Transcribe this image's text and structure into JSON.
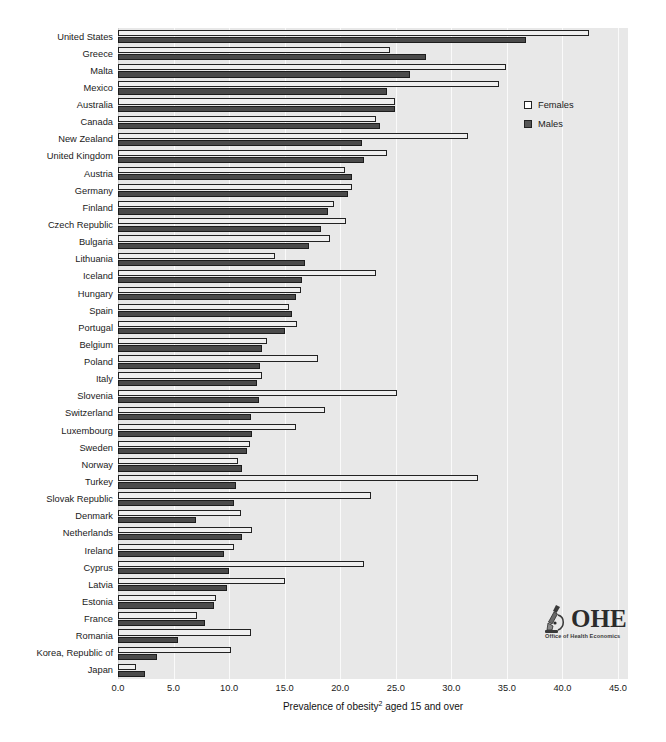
{
  "chart_data": {
    "type": "bar",
    "orientation": "horizontal",
    "title": "",
    "xlabel": "Prevalence of obesity2 aged 15 and over",
    "xlabel_base": "Prevalence of obesity",
    "xlabel_sup": "2",
    "xlabel_tail": " aged 15 and over",
    "ylabel": "",
    "xlim": [
      0.0,
      45.9
    ],
    "xticks": [
      "0.0",
      "5.0",
      "10.0",
      "15.0",
      "20.0",
      "25.0",
      "30.0",
      "35.0",
      "40.0",
      "45.0"
    ],
    "xtick_values": [
      0,
      5,
      10,
      15,
      20,
      25,
      30,
      35,
      40,
      45
    ],
    "grid": true,
    "legend_position": "upper right",
    "categories": [
      "United States",
      "Greece",
      "Malta",
      "Mexico",
      "Australia",
      "Canada",
      "New Zealand",
      "United Kingdom",
      "Austria",
      "Germany",
      "Finland",
      "Czech Republic",
      "Bulgaria",
      "Lithuania",
      "Iceland",
      "Hungary",
      "Spain",
      "Portugal",
      "Belgium",
      "Poland",
      "Italy",
      "Slovenia",
      "Switzerland",
      "Luxembourg",
      "Sweden",
      "Norway",
      "Turkey",
      "Slovak Republic",
      "Denmark",
      "Netherlands",
      "Ireland",
      "Cyprus",
      "Latvia",
      "Estonia",
      "France",
      "Romania",
      "Korea, Republic of",
      "Japan"
    ],
    "series": [
      {
        "name": "Females",
        "color": "#efefef",
        "values": [
          42.4,
          24.5,
          34.9,
          34.3,
          24.9,
          23.2,
          31.5,
          24.2,
          20.4,
          21.1,
          19.4,
          20.5,
          19.1,
          14.1,
          23.2,
          16.5,
          15.4,
          16.1,
          13.4,
          18.0,
          13.0,
          25.1,
          18.6,
          16.0,
          11.9,
          10.8,
          32.4,
          22.8,
          11.1,
          12.1,
          10.4,
          22.1,
          15.0,
          8.8,
          7.1,
          12.0,
          10.2,
          1.6
        ]
      },
      {
        "name": "Males",
        "color": "#4a4a4a",
        "values": [
          36.7,
          27.7,
          26.3,
          24.2,
          24.9,
          23.6,
          22.0,
          22.1,
          21.1,
          20.7,
          18.9,
          18.3,
          17.2,
          16.8,
          16.6,
          16.0,
          15.7,
          15.0,
          13.0,
          12.8,
          12.5,
          12.7,
          12.0,
          12.1,
          11.6,
          11.2,
          10.6,
          10.4,
          7.0,
          11.2,
          9.5,
          10.0,
          9.8,
          8.6,
          7.8,
          5.4,
          3.5,
          2.4
        ]
      }
    ]
  },
  "legend": {
    "items": [
      {
        "label": "Females",
        "key": "female"
      },
      {
        "label": "Males",
        "key": "male"
      }
    ]
  },
  "logo": {
    "mark": "microscope-icon",
    "acronym": "OHE",
    "tagline": "Office of Health Economics"
  }
}
